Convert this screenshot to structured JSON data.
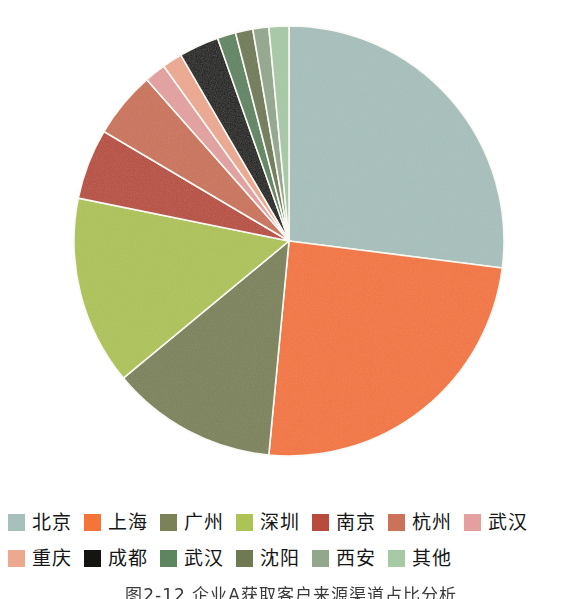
{
  "figure": {
    "caption": "图2-12  企业A获取客户来源渠道占比分析"
  },
  "chart_data": {
    "type": "pie",
    "title": "图2-12  企业A获取客户来源渠道占比分析",
    "xlabel": "",
    "ylabel": "",
    "legend_position": "bottom",
    "grid": false,
    "start_angle_deg": 0,
    "direction": "clockwise",
    "center_px": [
      289,
      241
    ],
    "radius_px": 215,
    "categories": [
      "北京",
      "上海",
      "广州",
      "深圳",
      "南京",
      "杭州",
      "武汉",
      "重庆",
      "成都",
      "武汉",
      "沈阳",
      "西安",
      "其他"
    ],
    "values": [
      27.0,
      24.5,
      12.5,
      14.2,
      5.3,
      5.0,
      1.6,
      1.5,
      3.0,
      1.4,
      1.3,
      1.2,
      1.5
    ],
    "colors": [
      "#a7c0bc",
      "#f4743a",
      "#7b8258",
      "#aec355",
      "#b84b3c",
      "#cb7259",
      "#e4a0a0",
      "#eda890",
      "#141410",
      "#5e8460",
      "#6f7a55",
      "#93a78d",
      "#a7c9a6"
    ],
    "slices": [
      {
        "label": "北京",
        "value": 27.0,
        "color": "#a7c0bc",
        "start_deg": 0.0,
        "end_deg": 97.2
      },
      {
        "label": "上海",
        "value": 24.5,
        "color": "#f4743a",
        "start_deg": 97.2,
        "end_deg": 185.4
      },
      {
        "label": "广州",
        "value": 12.5,
        "color": "#7b8258",
        "start_deg": 185.4,
        "end_deg": 230.4
      },
      {
        "label": "深圳",
        "value": 14.2,
        "color": "#aec355",
        "start_deg": 230.4,
        "end_deg": 281.5
      },
      {
        "label": "南京",
        "value": 5.3,
        "color": "#b84b3c",
        "start_deg": 281.5,
        "end_deg": 300.6
      },
      {
        "label": "杭州",
        "value": 5.0,
        "color": "#cb7259",
        "start_deg": 300.6,
        "end_deg": 318.6
      },
      {
        "label": "武汉",
        "value": 1.6,
        "color": "#e4a0a0",
        "start_deg": 318.6,
        "end_deg": 324.4
      },
      {
        "label": "重庆",
        "value": 1.5,
        "color": "#eda890",
        "start_deg": 324.4,
        "end_deg": 329.8
      },
      {
        "label": "成都",
        "value": 3.0,
        "color": "#141410",
        "start_deg": 329.8,
        "end_deg": 340.6
      },
      {
        "label": "武汉",
        "value": 1.4,
        "color": "#5e8460",
        "start_deg": 340.6,
        "end_deg": 345.6
      },
      {
        "label": "沈阳",
        "value": 1.3,
        "color": "#6f7a55",
        "start_deg": 345.6,
        "end_deg": 350.3
      },
      {
        "label": "西安",
        "value": 1.2,
        "color": "#93a78d",
        "start_deg": 350.3,
        "end_deg": 354.6
      },
      {
        "label": "其他",
        "value": 1.5,
        "color": "#a7c9a6",
        "start_deg": 354.6,
        "end_deg": 360.0
      }
    ]
  },
  "legend": {
    "rows": [
      [
        {
          "label": "北京",
          "color": "#a7c0bc"
        },
        {
          "label": "上海",
          "color": "#f4743a"
        },
        {
          "label": "广州",
          "color": "#7b8258"
        },
        {
          "label": "深圳",
          "color": "#aec355"
        },
        {
          "label": "南京",
          "color": "#b84b3c"
        },
        {
          "label": "杭州",
          "color": "#cb7259"
        },
        {
          "label": "武汉",
          "color": "#e4a0a0"
        }
      ],
      [
        {
          "label": "重庆",
          "color": "#eda890"
        },
        {
          "label": "成都",
          "color": "#141410"
        },
        {
          "label": "武汉",
          "color": "#5e8460"
        },
        {
          "label": "沈阳",
          "color": "#6f7a55"
        },
        {
          "label": "西安",
          "color": "#93a78d"
        },
        {
          "label": "其他",
          "color": "#a7c9a6"
        }
      ]
    ]
  }
}
